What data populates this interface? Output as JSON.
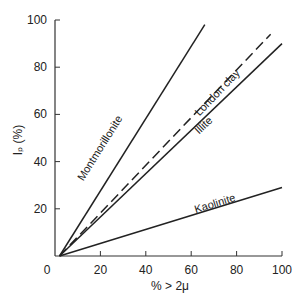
{
  "chart_data": {
    "type": "line",
    "title": "",
    "xlabel": "% > 2μ",
    "ylabel": "Iₚ (%)",
    "xlim": [
      0,
      100
    ],
    "ylim": [
      0,
      100
    ],
    "x_ticks": [
      "0",
      "20",
      "40",
      "60",
      "80",
      "100"
    ],
    "y_ticks": [
      "20",
      "40",
      "60",
      "80",
      "100"
    ],
    "grid": false,
    "legend": "inline labels",
    "series": [
      {
        "name": "Montmorillonite",
        "style": "solid",
        "x": [
          2,
          66
        ],
        "y": [
          0,
          98
        ]
      },
      {
        "name": "London clay",
        "style": "dashed",
        "x": [
          2,
          95
        ],
        "y": [
          0,
          94
        ]
      },
      {
        "name": "Illite",
        "style": "solid",
        "x": [
          2,
          100
        ],
        "y": [
          0,
          90
        ]
      },
      {
        "name": "Kaolinite",
        "style": "solid",
        "x": [
          2,
          100
        ],
        "y": [
          0,
          29
        ]
      }
    ]
  }
}
